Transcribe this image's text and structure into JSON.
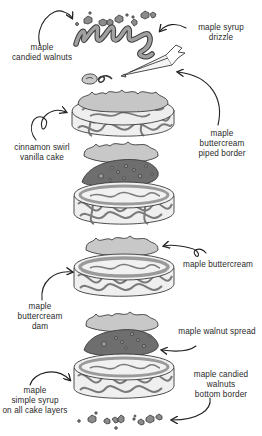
{
  "diagram": {
    "colors": {
      "outline": "#3a3a3a",
      "cake_fill": "#f2f2f2",
      "cinnamon_swirl": "#6a6a6a",
      "buttercream": "#c9c9c9",
      "walnut_spread": "#6e6e6e",
      "syrup": "#9a9a9a",
      "walnut": "#8c8c8c",
      "text": "#2a2a2a"
    },
    "labels": {
      "candied_walnuts": "maple\ncandied walnuts",
      "syrup_drizzle": "maple syrup\ndrizzle",
      "piped_border": "maple\nbuttercream\npiped border",
      "cake": "cinnamon swirl\nvanilla cake",
      "buttercream": "maple buttercream",
      "buttercream_dam": "maple\nbuttercream\ndam",
      "walnut_spread": "maple walnut spread",
      "simple_syrup": "maple\nsimple syrup\non all cake layers",
      "bottom_border": "maple candied\nwalnuts\nbottom border"
    },
    "layers_top_to_bottom": [
      "maple candied walnuts",
      "maple syrup drizzle",
      "maple buttercream piped border",
      "maple buttercream",
      "cinnamon swirl vanilla cake",
      "maple buttercream",
      "maple walnut spread",
      "cinnamon swirl vanilla cake",
      "maple buttercream",
      "maple buttercream dam",
      "cinnamon swirl vanilla cake",
      "maple buttercream",
      "maple walnut spread",
      "cinnamon swirl vanilla cake",
      "maple candied walnuts bottom border"
    ]
  }
}
